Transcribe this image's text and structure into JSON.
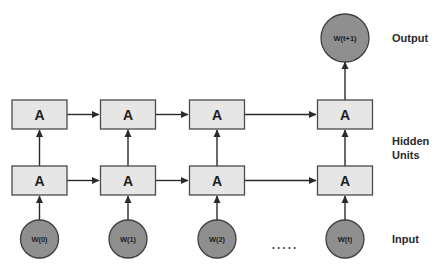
{
  "diagram": {
    "type": "unrolled-recurrent-neural-network",
    "colors": {
      "box_fill": "#e6e6e6",
      "box_stroke": "#4a4a4a",
      "node_fill": "#8f8f8f",
      "node_stroke": "#3e3e3e",
      "edge": "#2a2a2a",
      "text": "#1e1e1e"
    },
    "side_labels": {
      "output": "Output",
      "hidden_line1": "Hidden",
      "hidden_line2": "Units",
      "input": "Input"
    },
    "ellipsis": ".....",
    "hidden_top": [
      {
        "label": "A"
      },
      {
        "label": "A"
      },
      {
        "label": "A"
      },
      {
        "label": "A"
      }
    ],
    "hidden_bottom": [
      {
        "label": "A"
      },
      {
        "label": "A"
      },
      {
        "label": "A"
      },
      {
        "label": "A"
      }
    ],
    "inputs": [
      {
        "label": "W(0)"
      },
      {
        "label": "W(1)"
      },
      {
        "label": "W(2)"
      },
      {
        "label": "W(t)"
      }
    ],
    "output": {
      "label": "W(t+1)"
    }
  }
}
